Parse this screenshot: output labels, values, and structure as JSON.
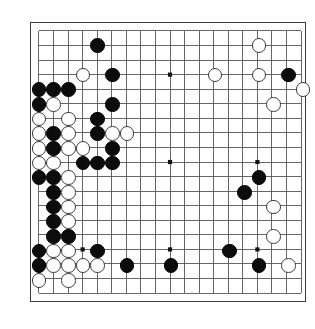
{
  "app": {
    "title": "Go Board Position",
    "board_type": "go-board",
    "size": 19
  },
  "board": {
    "columns": 19,
    "rows": 19,
    "origin_x": 8,
    "origin_y": 8,
    "spacing": 14.67,
    "line_color": "#555555",
    "border_color": "#3a3a3a",
    "background_color": "#ffffff",
    "star_point_color": "#111111",
    "star_point_radius": 2.1,
    "stone_radius": 7.3,
    "star_points": [
      [
        3,
        3
      ],
      [
        9,
        3
      ],
      [
        15,
        3
      ],
      [
        3,
        9
      ],
      [
        9,
        9
      ],
      [
        15,
        9
      ],
      [
        3,
        15
      ],
      [
        9,
        15
      ],
      [
        15,
        15
      ]
    ],
    "stone_colors": {
      "black": "#0c0c0c",
      "white": "#ffffff",
      "white_border": "#3b3b3b"
    },
    "stones": [
      {
        "c": 4,
        "r": 1,
        "color": "black"
      },
      {
        "c": 3,
        "r": 3,
        "color": "white"
      },
      {
        "c": 5,
        "r": 3,
        "color": "black"
      },
      {
        "c": 12,
        "r": 3,
        "color": "white"
      },
      {
        "c": 15,
        "r": 1,
        "color": "white"
      },
      {
        "c": 15,
        "r": 3,
        "color": "white"
      },
      {
        "c": 17,
        "r": 3,
        "color": "black"
      },
      {
        "c": 18,
        "r": 4,
        "color": "white"
      },
      {
        "c": 16,
        "r": 5,
        "color": "white"
      },
      {
        "c": 0,
        "r": 4,
        "color": "black"
      },
      {
        "c": 1,
        "r": 4,
        "color": "black"
      },
      {
        "c": 2,
        "r": 4,
        "color": "black"
      },
      {
        "c": 0,
        "r": 5,
        "color": "black"
      },
      {
        "c": 1,
        "r": 5,
        "color": "white"
      },
      {
        "c": 5,
        "r": 5,
        "color": "black"
      },
      {
        "c": 0,
        "r": 6,
        "color": "white"
      },
      {
        "c": 2,
        "r": 6,
        "color": "white"
      },
      {
        "c": 4,
        "r": 6,
        "color": "black"
      },
      {
        "c": 0,
        "r": 7,
        "color": "white"
      },
      {
        "c": 1,
        "r": 7,
        "color": "black"
      },
      {
        "c": 2,
        "r": 7,
        "color": "white"
      },
      {
        "c": 4,
        "r": 7,
        "color": "black"
      },
      {
        "c": 5,
        "r": 7,
        "color": "white"
      },
      {
        "c": 6,
        "r": 7,
        "color": "white"
      },
      {
        "c": 0,
        "r": 8,
        "color": "white"
      },
      {
        "c": 1,
        "r": 8,
        "color": "black"
      },
      {
        "c": 2,
        "r": 8,
        "color": "white"
      },
      {
        "c": 3,
        "r": 8,
        "color": "white"
      },
      {
        "c": 5,
        "r": 8,
        "color": "black"
      },
      {
        "c": 0,
        "r": 9,
        "color": "white"
      },
      {
        "c": 1,
        "r": 9,
        "color": "white"
      },
      {
        "c": 3,
        "r": 9,
        "color": "black"
      },
      {
        "c": 4,
        "r": 9,
        "color": "black"
      },
      {
        "c": 5,
        "r": 9,
        "color": "black"
      },
      {
        "c": 0,
        "r": 10,
        "color": "black"
      },
      {
        "c": 1,
        "r": 10,
        "color": "black"
      },
      {
        "c": 2,
        "r": 10,
        "color": "white"
      },
      {
        "c": 1,
        "r": 11,
        "color": "black"
      },
      {
        "c": 2,
        "r": 11,
        "color": "white"
      },
      {
        "c": 1,
        "r": 12,
        "color": "black"
      },
      {
        "c": 2,
        "r": 12,
        "color": "white"
      },
      {
        "c": 1,
        "r": 13,
        "color": "black"
      },
      {
        "c": 2,
        "r": 13,
        "color": "white"
      },
      {
        "c": 1,
        "r": 14,
        "color": "black"
      },
      {
        "c": 2,
        "r": 14,
        "color": "black"
      },
      {
        "c": 0,
        "r": 15,
        "color": "black"
      },
      {
        "c": 1,
        "r": 15,
        "color": "white"
      },
      {
        "c": 2,
        "r": 15,
        "color": "white"
      },
      {
        "c": 4,
        "r": 15,
        "color": "black"
      },
      {
        "c": 0,
        "r": 16,
        "color": "black"
      },
      {
        "c": 1,
        "r": 16,
        "color": "white"
      },
      {
        "c": 2,
        "r": 16,
        "color": "white"
      },
      {
        "c": 3,
        "r": 16,
        "color": "white"
      },
      {
        "c": 4,
        "r": 16,
        "color": "white"
      },
      {
        "c": 6,
        "r": 16,
        "color": "black"
      },
      {
        "c": 9,
        "r": 16,
        "color": "black"
      },
      {
        "c": 15,
        "r": 16,
        "color": "black"
      },
      {
        "c": 17,
        "r": 16,
        "color": "white"
      },
      {
        "c": 0,
        "r": 17,
        "color": "white"
      },
      {
        "c": 2,
        "r": 17,
        "color": "white"
      },
      {
        "c": 15,
        "r": 10,
        "color": "black"
      },
      {
        "c": 14,
        "r": 11,
        "color": "black"
      },
      {
        "c": 16,
        "r": 12,
        "color": "white"
      },
      {
        "c": 16,
        "r": 14,
        "color": "white"
      },
      {
        "c": 13,
        "r": 15,
        "color": "black"
      }
    ]
  }
}
